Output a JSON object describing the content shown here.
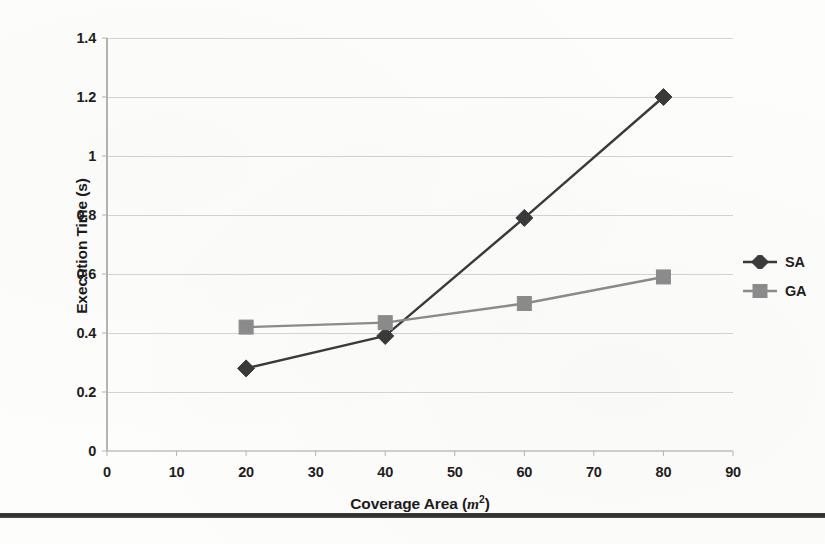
{
  "chart_data": {
    "type": "line",
    "title": "",
    "xlabel": "Coverage Area (m2)",
    "xlabel_text": "Coverage Area (",
    "xlabel_unit": "m",
    "xlabel_exponent": "2",
    "xlabel_close": ")",
    "ylabel": "Execution Time (s)",
    "xlim": [
      0,
      90
    ],
    "ylim": [
      0,
      1.4
    ],
    "xticks": [
      "0",
      "10",
      "20",
      "30",
      "40",
      "50",
      "60",
      "70",
      "80",
      "90"
    ],
    "xtick_values": [
      0,
      10,
      20,
      30,
      40,
      50,
      60,
      70,
      80,
      90
    ],
    "yticks": [
      "0",
      "0.2",
      "0.4",
      "0.6",
      "0.8",
      "1",
      "1.2",
      "1.4"
    ],
    "ytick_values": [
      0,
      0.2,
      0.4,
      0.6,
      0.8,
      1,
      1.2,
      1.4
    ],
    "grid": "horizontal",
    "legend_position": "right",
    "x": [
      20,
      40,
      60,
      80
    ],
    "series": [
      {
        "name": "SA",
        "marker": "diamond",
        "color": "#3a3a3a",
        "values": [
          0.28,
          0.39,
          0.79,
          1.2
        ]
      },
      {
        "name": "GA",
        "marker": "square",
        "color": "#8c8c8c",
        "values": [
          0.42,
          0.435,
          0.5,
          0.59
        ]
      }
    ]
  },
  "colors": {
    "gridline": "#cfcfcf",
    "axis": "#b4b4b4",
    "text": "#1e1e1e",
    "rule": "#1a1a1a"
  }
}
